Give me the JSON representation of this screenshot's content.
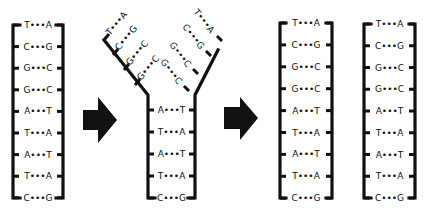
{
  "diagram": {
    "colors": {
      "ink": "#111111",
      "background": "#ffffff"
    },
    "original": {
      "label": "Original double helix",
      "pairs": [
        "T•••A",
        "C•••G",
        "G•••C",
        "G•••C",
        "A•••T",
        "T•••A",
        "A•••T",
        "T•••A",
        "C•••G"
      ]
    },
    "arrow1": {
      "icon": "right-arrow-icon"
    },
    "unzipping": {
      "label": "Unzipping replication fork",
      "left_branch": [
        "T•••A",
        "C•••G",
        "G•••C",
        "G•••C"
      ],
      "right_branch": [
        "T•••A",
        "C•••G",
        "G•••C",
        "G•••C"
      ],
      "stem": [
        "A•••T",
        "T•••A",
        "A•••T",
        "T•••A",
        "C•••G"
      ]
    },
    "arrow2": {
      "icon": "right-arrow-icon"
    },
    "daughter1": {
      "label": "Daughter molecule 1",
      "pairs": [
        "T•••A",
        "C•••G",
        "G•••C",
        "G•••C",
        "A•••T",
        "T•••A",
        "A•••T",
        "T•••A",
        "C•••G"
      ]
    },
    "daughter2": {
      "label": "Daughter molecule 2",
      "pairs": [
        "T•••A",
        "C•••G",
        "G•••C",
        "G•••C",
        "A•••T",
        "T•••A",
        "A•••T",
        "T•••A",
        "C•••G"
      ]
    }
  }
}
